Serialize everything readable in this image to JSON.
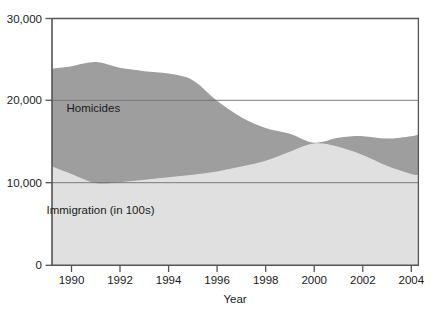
{
  "chart_data": {
    "type": "area",
    "stacked": true,
    "title": "",
    "subtitle": "",
    "xlabel": "Year",
    "ylabel": "",
    "xlim": [
      1989.2,
      2004.3
    ],
    "ylim": [
      0,
      30000
    ],
    "grid": true,
    "gridlines_y": [
      10000,
      20000
    ],
    "legend_position": "inline-annotation",
    "x_ticks": [
      1990,
      1992,
      1994,
      1996,
      1998,
      2000,
      2002,
      2004
    ],
    "x_tick_labels": [
      "1990",
      "1992",
      "1994",
      "1996",
      "1998",
      "2000",
      "2002",
      "2004"
    ],
    "y_ticks": [
      0,
      10000,
      20000,
      30000
    ],
    "y_tick_labels": [
      "0",
      "10,000",
      "20,000",
      "30,000"
    ],
    "x": [
      1989.2,
      1990,
      1991,
      1992,
      1993,
      1994,
      1995,
      1996,
      1997,
      1998,
      1999,
      2000,
      2001,
      2002,
      2003,
      2004,
      2004.3
    ],
    "series": [
      {
        "name": "Immigration (in 100s)",
        "color": "#e0e0e0",
        "values": [
          12000,
          11100,
          10000,
          10100,
          10400,
          10700,
          11000,
          11400,
          12000,
          12700,
          13800,
          14800,
          14400,
          13400,
          12100,
          11100,
          11000
        ]
      },
      {
        "name": "Homicides",
        "color": "#9e9e9e",
        "values": [
          11900,
          13100,
          14700,
          13900,
          13200,
          12600,
          11500,
          8600,
          6000,
          4000,
          2200,
          100,
          1100,
          2300,
          3300,
          4600,
          4900
        ]
      }
    ],
    "totals": [
      23900,
      24200,
      24700,
      24000,
      23600,
      23300,
      22500,
      20000,
      18000,
      16700,
      16000,
      14900,
      15500,
      15700,
      15400,
      15700,
      15900
    ],
    "annotations": [
      {
        "text": "Homicides",
        "x": 1990.9,
        "y": 18700
      },
      {
        "text": "Immigration (in 100s)",
        "x": 1991.2,
        "y": 6300
      }
    ],
    "colors": {
      "homicides_fill": "#9e9e9e",
      "immigration_fill": "#e0e0e0",
      "axis": "#4a4a4a",
      "gridline": "#808080",
      "text": "#1a1a1a",
      "background": "#ffffff"
    }
  },
  "axes": {
    "x_title": "Year",
    "y_tick_30000": "30,000",
    "y_tick_20000": "20,000",
    "y_tick_10000": "10,000",
    "y_tick_0": "0",
    "x_tick_1990": "1990",
    "x_tick_1992": "1992",
    "x_tick_1994": "1994",
    "x_tick_1996": "1996",
    "x_tick_1998": "1998",
    "x_tick_2000": "2000",
    "x_tick_2002": "2002",
    "x_tick_2004": "2004"
  },
  "labels": {
    "homicides": "Homicides",
    "immigration": "Immigration (in 100s)"
  }
}
